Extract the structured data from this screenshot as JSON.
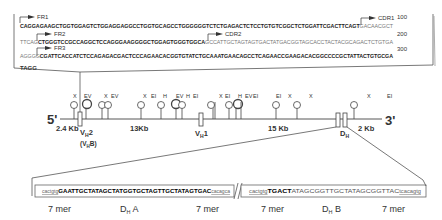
{
  "sequence_box": {
    "rows": [
      {
        "label": "FR1",
        "pre": "",
        "bold": "CAGGAGAAGCTGGTGGAGTCTGGAGGAGGCCTGGTGCAGCCTGGGGGGTCTCTGAGACTCTCCTGTGTCGGCTCTGGATTCGACTTCAGT",
        "post": "GACAACGCT",
        "number": "100"
      },
      {
        "label": "FR2",
        "pre": "TTCAG",
        "bold": "CTGGGTCCGCCAGGCTCCAGGGAAGGGGCTGGAGTGGGTGGCA",
        "post": "GCCATTGCTAGTAGTGACTATGACGGTAGCACCTACTACGCAGACTCTGTGA",
        "number": "200"
      },
      {
        "label": "FR3",
        "pre": "AGGGG",
        "bold": "CGATTCACCATCTCCAGAGACGACTCCCAGAACACGGTGTATCTGCAAATGAACAGCCTCAGAACCGAAGACACGGCCCCGCTATTACTGTGCGA",
        "post": "",
        "number": "300"
      }
    ],
    "cdr1_label": "CDR1",
    "cdr2_label": "CDR2",
    "last_row": "TAGG"
  },
  "gene_map": {
    "five_prime": "5'",
    "three_prime": "3'",
    "restriction_sites": [
      "X",
      "EV",
      "X",
      "EV",
      "X",
      "EI",
      "H",
      "EV",
      "H",
      "EI",
      "X",
      "EI",
      "H",
      "EV",
      "EI",
      "EI",
      "X",
      "X",
      "X",
      "EI"
    ],
    "distances": {
      "d1": "2.4 Kb",
      "d2": "13Kb",
      "d3": "15 Kb",
      "d4": "2 Kb"
    },
    "genes": {
      "vh2": "V",
      "vh2_sub": "H",
      "vh2_num": "2",
      "vh2_alt_open": "(V",
      "vh2_alt_sub": "H",
      "vh2_alt_close": "B)",
      "vh1": "V",
      "vh1_sub": "H",
      "vh1_num": "1",
      "dh": "D",
      "dh_sub": "H"
    }
  },
  "dh_segments": {
    "a": {
      "hept_left": "cactgtg",
      "core": "GAATTGCTATAGCTATGGTGCTAGTTGCTATAGTGAC",
      "hept_right": "cacagca"
    },
    "b": {
      "hept_left": "cactgtg",
      "core_bold": "TGACT",
      "core_light": "ATAGCGGTTGCTATAGCGGTTAC",
      "hept_right": "tcacagtg"
    },
    "labels": {
      "mer1": "7 mer",
      "dha": "D",
      "dha_sub": "H",
      "dha_suffix": " A",
      "mer2": "7 mer",
      "mer3": "7 mer",
      "dhb": "D",
      "dhb_sub": "H",
      "dhb_suffix": " B",
      "mer4": "7 mer"
    }
  }
}
